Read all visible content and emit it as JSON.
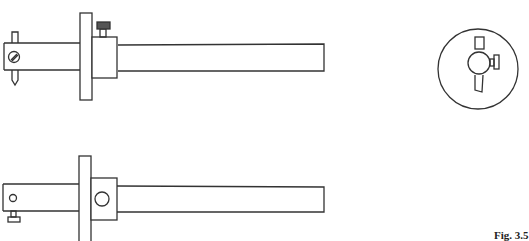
{
  "figure": {
    "label": "Fig. 3.5",
    "stroke_color": "#333333",
    "background": "#ffffff"
  },
  "views": [
    {
      "name": "top-elevation",
      "parts": [
        "stem",
        "fence",
        "thumbscrew",
        "marking-pin",
        "pin-set-screw"
      ]
    },
    {
      "name": "end-view",
      "parts": [
        "circular-fence-face",
        "stem-section",
        "pin",
        "side-screw"
      ]
    },
    {
      "name": "bottom-elevation",
      "parts": [
        "stem",
        "fence",
        "fence-hole",
        "stem-hole",
        "adjusting-screw"
      ]
    }
  ]
}
